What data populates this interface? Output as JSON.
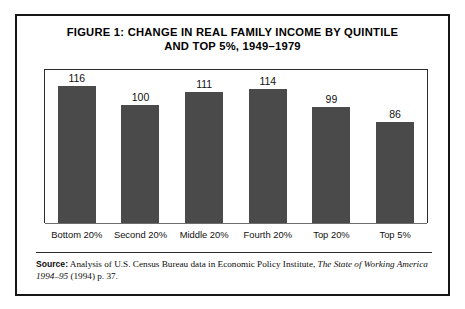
{
  "figure": {
    "title_line1": "FIGURE 1:  CHANGE IN REAL FAMILY INCOME BY QUINTILE",
    "title_line2": "AND TOP 5%, 1949–1979"
  },
  "source": {
    "label": "Source:",
    "text_before_italic": " Analysis of U.S. Census Bureau data in Economic Policy Institute, ",
    "italic_title": "The State of Working America 1994–95",
    "text_after_italic": " (1994) p. 37."
  },
  "colors": {
    "bar_fill": "#4a4a4a",
    "frame": "#161616",
    "plot_border": "#2b2b2b",
    "axis_line": "#6d6d6d",
    "background": "#ffffff"
  },
  "chart_data": {
    "type": "bar",
    "title": "FIGURE 1:  CHANGE IN REAL FAMILY INCOME BY QUINTILE AND TOP 5%, 1949–1979",
    "categories": [
      "Bottom 20%",
      "Second 20%",
      "Middle 20%",
      "Fourth 20%",
      "Top 20%",
      "Top 5%"
    ],
    "values": [
      116,
      100,
      111,
      114,
      99,
      86
    ],
    "value_labels": [
      "116",
      "100",
      "111",
      "114",
      "99",
      "86"
    ],
    "xlabel": "",
    "ylabel": "",
    "ylim": [
      0,
      130
    ],
    "grid": false,
    "legend": false
  }
}
